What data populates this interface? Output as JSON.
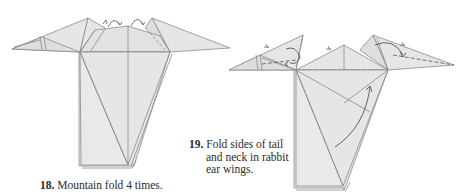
{
  "steps": [
    {
      "number": "18.",
      "text": "Mountain fold 4 times.",
      "fold_type": "mountain-fold",
      "repeat_symbols": 4
    },
    {
      "number": "19.",
      "text_lines": [
        "Fold sides of tail",
        "and neck in rabbit",
        "ear wings."
      ],
      "fold_type": "rabbit-ear"
    }
  ],
  "colors": {
    "paper": "#e6e6e6",
    "paper_shade": "#dcdcdc",
    "line": "#8a8a8a",
    "text": "#2b2b2b"
  }
}
